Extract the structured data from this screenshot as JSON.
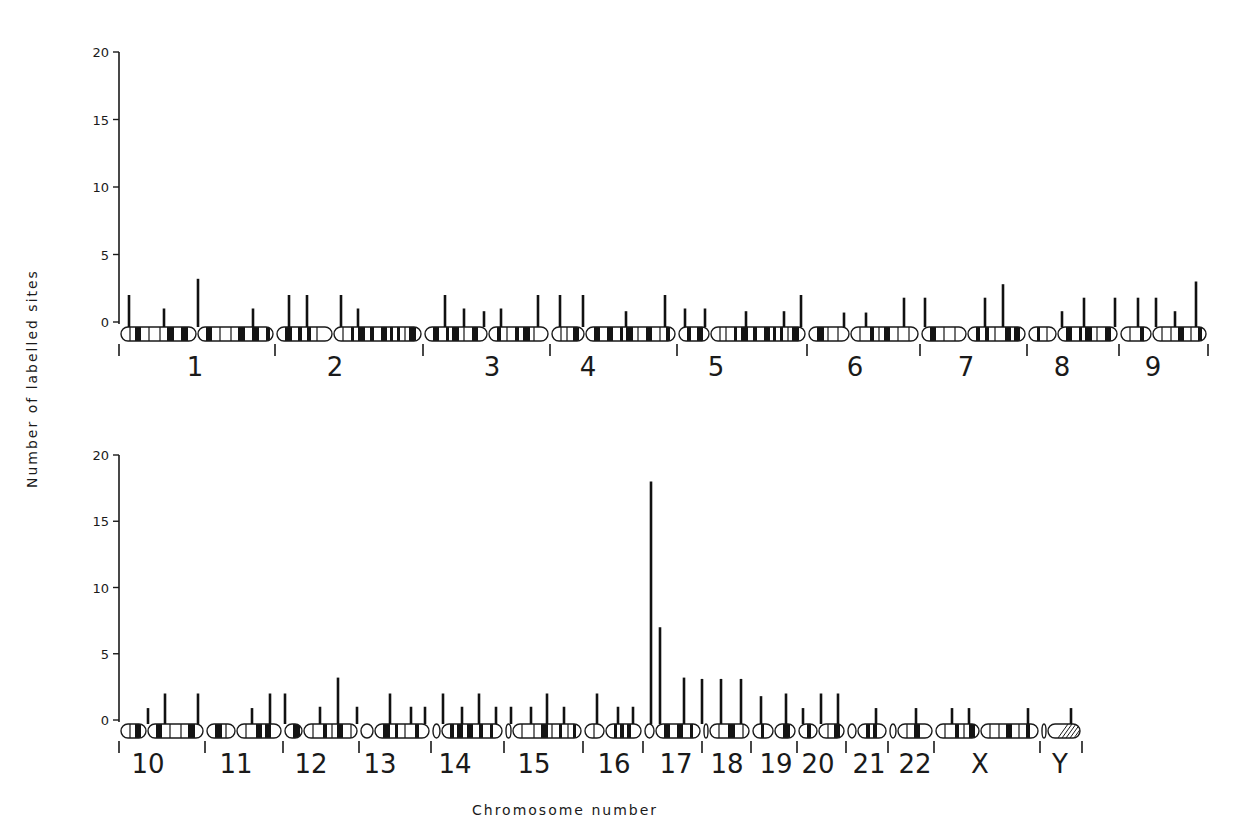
{
  "chart_data": {
    "type": "bar",
    "title": "",
    "xlabel": "Chromosome number",
    "ylabel": "Number of labelled sites",
    "ylim": [
      0,
      20
    ],
    "yticks": [
      0,
      5,
      10,
      15,
      20
    ],
    "grid": false,
    "legend": null,
    "panels": [
      {
        "name": "top",
        "axis": {
          "x": 119,
          "y0": 322,
          "y20": 52
        },
        "chromosome_y": 334,
        "chromosomes": [
          {
            "label": "1",
            "start": 119,
            "end": 275,
            "cen": 197,
            "label_x": 195,
            "bars": [
              {
                "x": 129,
                "v": 2
              },
              {
                "x": 164,
                "v": 1
              },
              {
                "x": 198,
                "v": 3.2
              },
              {
                "x": 253,
                "v": 1
              }
            ]
          },
          {
            "label": "2",
            "start": 275,
            "end": 423,
            "cen": 333,
            "label_x": 335,
            "bars": [
              {
                "x": 289,
                "v": 2
              },
              {
                "x": 307,
                "v": 2
              },
              {
                "x": 341,
                "v": 2
              },
              {
                "x": 358,
                "v": 1
              }
            ]
          },
          {
            "label": "3",
            "start": 423,
            "end": 550,
            "cen": 488,
            "label_x": 492,
            "bars": [
              {
                "x": 445,
                "v": 2
              },
              {
                "x": 464,
                "v": 1
              },
              {
                "x": 484,
                "v": 0.8
              },
              {
                "x": 501,
                "v": 1
              },
              {
                "x": 538,
                "v": 2
              }
            ]
          },
          {
            "label": "4",
            "start": 550,
            "end": 677,
            "cen": 585,
            "label_x": 588,
            "bars": [
              {
                "x": 560,
                "v": 2
              },
              {
                "x": 583,
                "v": 2
              },
              {
                "x": 626,
                "v": 0.8
              },
              {
                "x": 665,
                "v": 2
              }
            ]
          },
          {
            "label": "5",
            "start": 677,
            "end": 807,
            "cen": 710,
            "label_x": 716,
            "bars": [
              {
                "x": 685,
                "v": 1
              },
              {
                "x": 705,
                "v": 1
              },
              {
                "x": 746,
                "v": 0.8
              },
              {
                "x": 784,
                "v": 0.8
              },
              {
                "x": 801,
                "v": 2
              }
            ]
          },
          {
            "label": "6",
            "start": 807,
            "end": 920,
            "cen": 850,
            "label_x": 855,
            "bars": [
              {
                "x": 844,
                "v": 0.7
              },
              {
                "x": 866,
                "v": 0.7
              },
              {
                "x": 904,
                "v": 1.8
              }
            ]
          },
          {
            "label": "7",
            "start": 920,
            "end": 1027,
            "cen": 967,
            "label_x": 966,
            "bars": [
              {
                "x": 925,
                "v": 1.8
              },
              {
                "x": 985,
                "v": 1.8
              },
              {
                "x": 1003,
                "v": 2.8
              }
            ]
          },
          {
            "label": "8",
            "start": 1027,
            "end": 1119,
            "cen": 1057,
            "label_x": 1062,
            "bars": [
              {
                "x": 1062,
                "v": 0.8
              },
              {
                "x": 1084,
                "v": 1.8
              },
              {
                "x": 1115,
                "v": 1.8
              }
            ]
          },
          {
            "label": "9",
            "start": 1119,
            "end": 1208,
            "cen": 1152,
            "label_x": 1153,
            "bars": [
              {
                "x": 1138,
                "v": 1.8
              },
              {
                "x": 1156,
                "v": 1.8
              },
              {
                "x": 1175,
                "v": 0.8
              },
              {
                "x": 1196,
                "v": 3
              }
            ]
          }
        ]
      },
      {
        "name": "bottom",
        "axis": {
          "x": 119,
          "y0": 720,
          "y20": 455
        },
        "chromosome_y": 731,
        "chromosomes": [
          {
            "label": "10",
            "start": 119,
            "end": 205,
            "cen": 147,
            "label_x": 148,
            "bars": [
              {
                "x": 148,
                "v": 0.9
              },
              {
                "x": 165,
                "v": 2
              },
              {
                "x": 198,
                "v": 2
              }
            ]
          },
          {
            "label": "11",
            "start": 205,
            "end": 283,
            "cen": 236,
            "label_x": 236,
            "bars": [
              {
                "x": 252,
                "v": 0.9
              },
              {
                "x": 270,
                "v": 2
              }
            ]
          },
          {
            "label": "12",
            "start": 283,
            "end": 359,
            "cen": 303,
            "label_x": 311,
            "bars": [
              {
                "x": 285,
                "v": 2
              },
              {
                "x": 320,
                "v": 1
              },
              {
                "x": 338,
                "v": 3.2
              },
              {
                "x": 357,
                "v": 1
              }
            ]
          },
          {
            "label": "13",
            "start": 359,
            "end": 431,
            "cen": 374,
            "label_x": 380,
            "bars": [
              {
                "x": 390,
                "v": 2
              },
              {
                "x": 411,
                "v": 1
              },
              {
                "x": 425,
                "v": 1
              }
            ]
          },
          {
            "label": "14",
            "start": 431,
            "end": 504,
            "cen": 441,
            "label_x": 455,
            "bars": [
              {
                "x": 443,
                "v": 2
              },
              {
                "x": 462,
                "v": 1
              },
              {
                "x": 479,
                "v": 2
              },
              {
                "x": 496,
                "v": 1
              }
            ]
          },
          {
            "label": "15",
            "start": 504,
            "end": 583,
            "cen": 512,
            "label_x": 534,
            "bars": [
              {
                "x": 511,
                "v": 1
              },
              {
                "x": 531,
                "v": 1
              },
              {
                "x": 547,
                "v": 2
              },
              {
                "x": 564,
                "v": 1
              }
            ]
          },
          {
            "label": "16",
            "start": 583,
            "end": 643,
            "cen": 605,
            "label_x": 614,
            "bars": [
              {
                "x": 597,
                "v": 2
              },
              {
                "x": 618,
                "v": 1
              },
              {
                "x": 633,
                "v": 1
              }
            ]
          },
          {
            "label": "17",
            "start": 643,
            "end": 702,
            "cen": 655,
            "label_x": 676,
            "bars": [
              {
                "x": 651,
                "v": 18
              },
              {
                "x": 660,
                "v": 7
              },
              {
                "x": 684,
                "v": 3.2
              }
            ]
          },
          {
            "label": "18",
            "start": 702,
            "end": 751,
            "cen": 709,
            "label_x": 727,
            "bars": [
              {
                "x": 702,
                "v": 3.1
              },
              {
                "x": 721,
                "v": 3.1
              },
              {
                "x": 741,
                "v": 3.1
              }
            ]
          },
          {
            "label": "19",
            "start": 751,
            "end": 797,
            "cen": 774,
            "label_x": 776,
            "bars": [
              {
                "x": 761,
                "v": 1.8
              },
              {
                "x": 786,
                "v": 2
              }
            ]
          },
          {
            "label": "20",
            "start": 797,
            "end": 846,
            "cen": 818,
            "label_x": 818,
            "bars": [
              {
                "x": 803,
                "v": 0.9
              },
              {
                "x": 821,
                "v": 2
              },
              {
                "x": 838,
                "v": 2
              }
            ]
          },
          {
            "label": "21",
            "start": 846,
            "end": 888,
            "cen": 857,
            "label_x": 869,
            "bars": [
              {
                "x": 876,
                "v": 0.9
              }
            ]
          },
          {
            "label": "22",
            "start": 888,
            "end": 934,
            "cen": 897,
            "label_x": 915,
            "bars": [
              {
                "x": 916,
                "v": 0.9
              }
            ]
          },
          {
            "label": "X",
            "start": 934,
            "end": 1040,
            "cen": 980,
            "label_x": 980,
            "bars": [
              {
                "x": 952,
                "v": 0.9
              },
              {
                "x": 969,
                "v": 0.9
              },
              {
                "x": 1028,
                "v": 0.9
              }
            ]
          },
          {
            "label": "Y",
            "start": 1040,
            "end": 1082,
            "cen": 1047,
            "label_x": 1060,
            "bars": [
              {
                "x": 1071,
                "v": 0.9
              }
            ]
          }
        ]
      }
    ]
  }
}
